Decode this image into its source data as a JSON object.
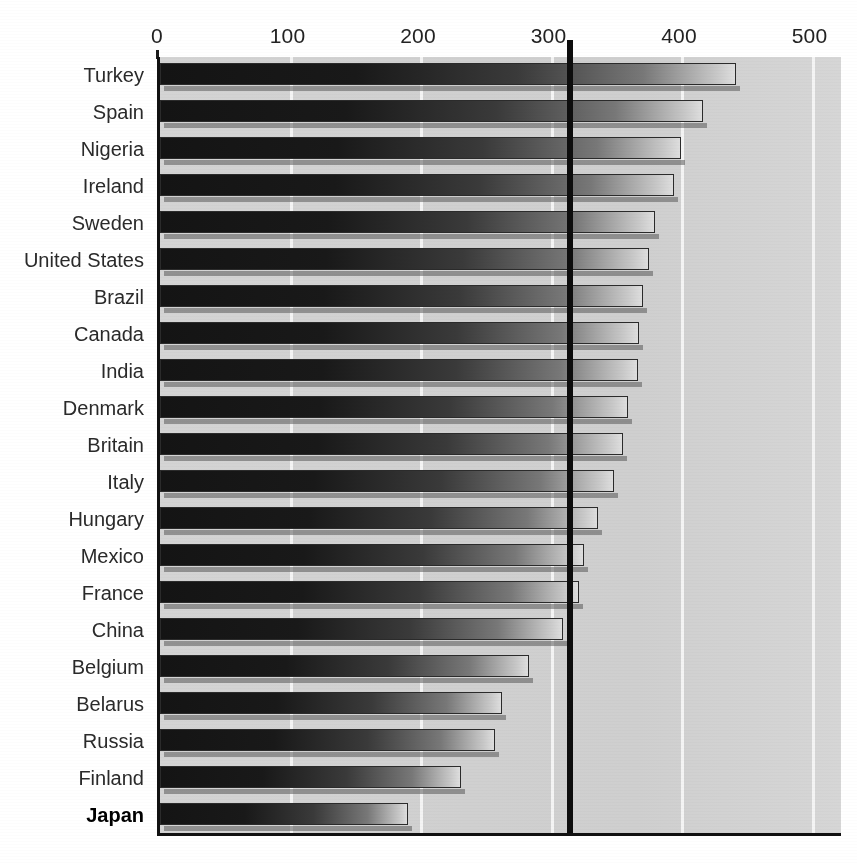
{
  "chart_data": {
    "type": "bar",
    "orientation": "horizontal",
    "title": "",
    "subtitle": "",
    "xlabel": "",
    "ylabel": "",
    "xlim": [
      0,
      522
    ],
    "axis_ticks": [
      0,
      100,
      200,
      300,
      400,
      500
    ],
    "tick_labels": [
      "0",
      "100",
      "200",
      "300",
      "400",
      "500"
    ],
    "gridlines": [
      100,
      200,
      300,
      400,
      500
    ],
    "grid": true,
    "legend": "none",
    "reference_line": {
      "value": 314,
      "label": "",
      "color": "#0d0d0d"
    },
    "highlight_category": "Japan",
    "categories": [
      "Turkey",
      "Spain",
      "Nigeria",
      "Ireland",
      "Sweden",
      "United States",
      "Brazil",
      "Canada",
      "India",
      "Denmark",
      "Britain",
      "Italy",
      "Hungary",
      "Mexico",
      "France",
      "China",
      "Belgium",
      "Belarus",
      "Russia",
      "Finland",
      "Japan"
    ],
    "values": [
      441,
      416,
      399,
      394,
      379,
      375,
      370,
      367,
      366,
      359,
      355,
      348,
      336,
      325,
      321,
      309,
      283,
      262,
      257,
      231,
      190
    ]
  },
  "colors": {
    "plot_background": "#d2d2d2",
    "bar_dark": "#141414",
    "bar_light": "#dedede",
    "gridline": "#f4f4f4",
    "axis": "#111111",
    "reference_line": "#0d0d0d",
    "label_text": "#2a2a2a"
  }
}
